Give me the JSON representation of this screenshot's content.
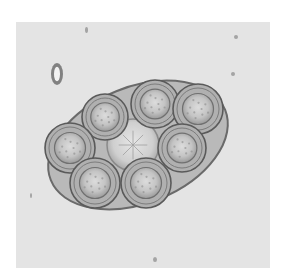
{
  "image": {
    "subject": "micrograph of an egg packet containing multiple eggs",
    "background_color": "#ffffff",
    "field_color": "#e4e4e4",
    "field": {
      "x": 16,
      "y": 22,
      "w": 254,
      "h": 246
    },
    "packet": {
      "cx": 138,
      "cy": 145,
      "rx": 94,
      "ry": 58,
      "rotate": -22,
      "fill": "#b9b9b9",
      "stroke": "#6a6a6a"
    },
    "eggs": [
      {
        "cx": 105,
        "cy": 117,
        "r": 23
      },
      {
        "cx": 155,
        "cy": 104,
        "r": 24
      },
      {
        "cx": 198,
        "cy": 109,
        "r": 25
      },
      {
        "cx": 70,
        "cy": 148,
        "r": 25
      },
      {
        "cx": 182,
        "cy": 148,
        "r": 24
      },
      {
        "cx": 95,
        "cy": 183,
        "r": 25
      },
      {
        "cx": 146,
        "cy": 183,
        "r": 25
      }
    ],
    "center_cell": {
      "cx": 133,
      "cy": 145,
      "r": 26
    },
    "debris": [
      {
        "x": 51,
        "y": 63,
        "w": 12,
        "h": 22
      },
      {
        "x": 85,
        "y": 27,
        "w": 3,
        "h": 6
      },
      {
        "x": 234,
        "y": 35,
        "w": 4,
        "h": 4
      },
      {
        "x": 231,
        "y": 72,
        "w": 4,
        "h": 4
      },
      {
        "x": 153,
        "y": 257,
        "w": 4,
        "h": 5
      },
      {
        "x": 30,
        "y": 193,
        "w": 2,
        "h": 5
      }
    ]
  }
}
